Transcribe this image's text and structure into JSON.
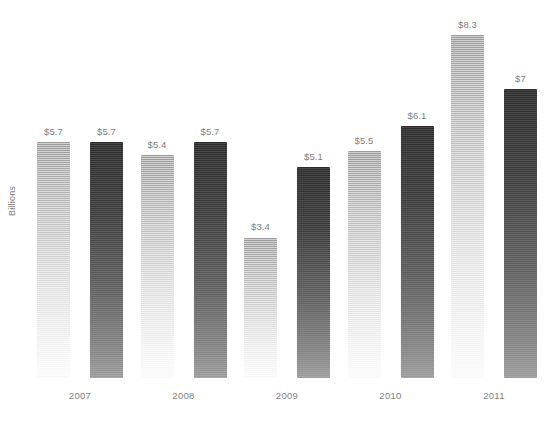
{
  "chart_data": {
    "type": "bar",
    "title": "",
    "subtitle": "",
    "xlabel": "",
    "ylabel": "Billions",
    "ylim": [
      0,
      9
    ],
    "grid": false,
    "legend": "none",
    "orientation": "vertical",
    "grouped": true,
    "categories": [
      "2007",
      "2008",
      "2009",
      "2010",
      "2011"
    ],
    "series": [
      {
        "name": "series-light",
        "color_top": "#9a9a9a",
        "color_bottom": "#fafafa",
        "values": [
          5.7,
          5.4,
          3.4,
          5.5,
          8.3
        ],
        "labels": [
          "$5.7",
          "$5.4",
          "$3.4",
          "$5.5",
          "$8.3"
        ]
      },
      {
        "name": "series-dark",
        "color_top": "#2c2c2c",
        "color_bottom": "#9b9b9b",
        "values": [
          5.7,
          5.7,
          5.1,
          6.1,
          7.0
        ],
        "labels": [
          "$5.7",
          "$5.7",
          "$5.1",
          "$6.1",
          "$7"
        ]
      }
    ],
    "value_prefix": "$",
    "value_unit": "Billions"
  },
  "axis": {
    "y_title": "Billions",
    "tick_labels": [
      "2007",
      "2008",
      "2009",
      "2010",
      "2011"
    ]
  },
  "colors": {
    "background": "#ffffff",
    "label_text": "#7f7f7f",
    "axis_text": "#7b7b7b",
    "light_bar_top": "#9a9a9a",
    "light_bar_bottom": "#fafafa",
    "dark_bar_top": "#2c2c2c",
    "dark_bar_bottom": "#9b9b9b"
  },
  "groups": [
    {
      "category": "2007",
      "bars": [
        {
          "label": "$5.7",
          "value": 5.7,
          "series": "light"
        },
        {
          "label": "$5.7",
          "value": 5.7,
          "series": "dark"
        }
      ]
    },
    {
      "category": "2008",
      "bars": [
        {
          "label": "$5.4",
          "value": 5.4,
          "series": "light"
        },
        {
          "label": "$5.7",
          "value": 5.7,
          "series": "dark"
        }
      ]
    },
    {
      "category": "2009",
      "bars": [
        {
          "label": "$3.4",
          "value": 3.4,
          "series": "light"
        },
        {
          "label": "$5.1",
          "value": 5.1,
          "series": "dark"
        }
      ]
    },
    {
      "category": "2010",
      "bars": [
        {
          "label": "$5.5",
          "value": 5.5,
          "series": "light"
        },
        {
          "label": "$6.1",
          "value": 6.1,
          "series": "dark"
        }
      ]
    },
    {
      "category": "2011",
      "bars": [
        {
          "label": "$8.3",
          "value": 8.3,
          "series": "light"
        },
        {
          "label": "$7",
          "value": 7.0,
          "series": "dark"
        }
      ]
    }
  ]
}
